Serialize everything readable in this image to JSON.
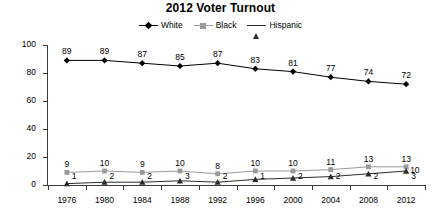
{
  "chart_data": {
    "type": "line",
    "title": "2012 Voter Turnout",
    "xlabel": "",
    "ylabel": "",
    "categories": [
      "1976",
      "1980",
      "1984",
      "1988",
      "1992",
      "1996",
      "2000",
      "2004",
      "2008",
      "2012"
    ],
    "ylim": [
      0,
      100
    ],
    "yticks": [
      0,
      20,
      40,
      60,
      80,
      100
    ],
    "grid": false,
    "legend_position": "top-center",
    "series": [
      {
        "name": "White",
        "marker": "diamond",
        "color": "#000000",
        "values": [
          89,
          89,
          87,
          85,
          87,
          83,
          81,
          77,
          74,
          72
        ]
      },
      {
        "name": "Black",
        "marker": "square",
        "color": "#9a9a9a",
        "values": [
          9,
          10,
          9,
          10,
          8,
          10,
          10,
          11,
          13,
          13
        ]
      },
      {
        "name": "Hispanic",
        "marker": "triangle",
        "color": "#2b2b2b",
        "values": [
          1,
          2,
          2,
          3,
          2,
          4,
          5,
          6,
          8,
          10
        ]
      }
    ],
    "data_labels": {
      "White": [
        "89",
        "89",
        "87",
        "85",
        "87",
        "83",
        "81",
        "77",
        "74",
        "72"
      ],
      "Black": [
        "9",
        "10",
        "9",
        "10",
        "8",
        "10",
        "10",
        "11",
        "13",
        "13"
      ],
      "Hispanic": [
        "1",
        "2",
        "2",
        "3",
        "2",
        "1",
        "2",
        "2",
        "2",
        "3"
      ],
      "Hispanic_last": "10"
    }
  },
  "legend": {
    "items": [
      {
        "label": "White"
      },
      {
        "label": "Black"
      },
      {
        "label": "Hispanic"
      }
    ]
  }
}
